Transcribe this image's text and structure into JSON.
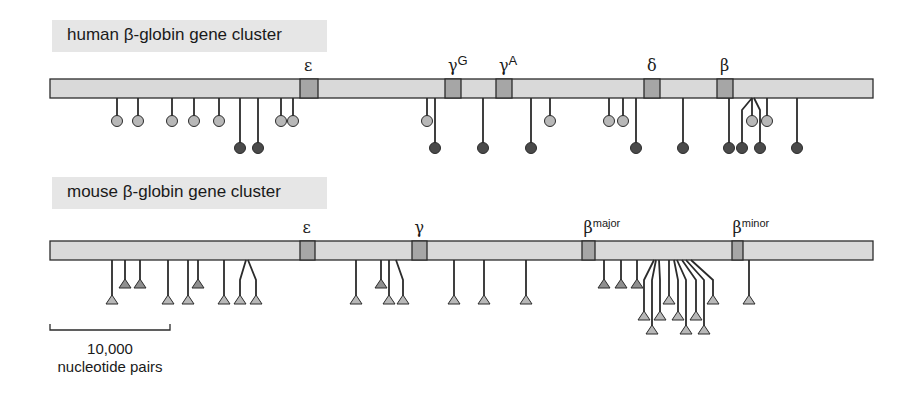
{
  "human": {
    "title": "human β-globin gene cluster",
    "bar": {
      "x1": 50,
      "x2": 873,
      "y": 79,
      "h": 19
    },
    "genes": [
      {
        "label": "ε",
        "sup": "",
        "x": 300,
        "w": 18
      },
      {
        "label": "γ",
        "sup": "G",
        "x": 445,
        "w": 16
      },
      {
        "label": "γ",
        "sup": "A",
        "x": 496,
        "w": 16
      },
      {
        "label": "δ",
        "sup": "",
        "x": 644,
        "w": 16
      },
      {
        "label": "β",
        "sup": "",
        "x": 717,
        "w": 16
      }
    ],
    "sites": [
      {
        "x": 117,
        "type": "light"
      },
      {
        "x": 138,
        "type": "light"
      },
      {
        "x": 172,
        "type": "light"
      },
      {
        "x": 194,
        "type": "light"
      },
      {
        "x": 219,
        "type": "light"
      },
      {
        "x": 240,
        "type": "dark"
      },
      {
        "x": 258,
        "type": "dark"
      },
      {
        "x": 281,
        "type": "light"
      },
      {
        "x": 293,
        "type": "light"
      },
      {
        "x": 427,
        "type": "light"
      },
      {
        "x": 435,
        "type": "dark"
      },
      {
        "x": 483,
        "type": "dark"
      },
      {
        "x": 531,
        "type": "dark"
      },
      {
        "x": 550,
        "type": "light"
      },
      {
        "x": 609,
        "type": "light"
      },
      {
        "x": 623,
        "type": "light"
      },
      {
        "x": 636,
        "type": "dark"
      },
      {
        "x": 683,
        "type": "dark"
      },
      {
        "x": 729,
        "type": "dark"
      },
      {
        "x": 742,
        "type": "dark",
        "from": 752
      },
      {
        "x": 752,
        "type": "light"
      },
      {
        "x": 760,
        "type": "dark",
        "from": 754
      },
      {
        "x": 767,
        "type": "light"
      },
      {
        "x": 797,
        "type": "dark"
      }
    ]
  },
  "mouse": {
    "title": "mouse β-globin gene cluster",
    "bar": {
      "x1": 50,
      "x2": 873,
      "y": 241,
      "h": 19
    },
    "genes": [
      {
        "label": "ε",
        "sup": "",
        "x": 300,
        "w": 15
      },
      {
        "label": "γ",
        "sup": "",
        "x": 412,
        "w": 15
      },
      {
        "label": "β",
        "sup": "major",
        "x": 582,
        "w": 13
      },
      {
        "label": "β",
        "sup": "minor",
        "x": 732,
        "w": 11
      }
    ],
    "sites": [
      {
        "x": 112,
        "level": 2
      },
      {
        "x": 125,
        "level": 1
      },
      {
        "x": 140,
        "level": 1
      },
      {
        "x": 168,
        "level": 2
      },
      {
        "x": 188,
        "level": 2
      },
      {
        "x": 198,
        "level": 1
      },
      {
        "x": 224,
        "level": 2
      },
      {
        "x": 240,
        "level": 2,
        "from": 246
      },
      {
        "x": 256,
        "level": 2,
        "from": 248
      },
      {
        "x": 356,
        "level": 2
      },
      {
        "x": 381,
        "level": 1
      },
      {
        "x": 389,
        "level": 2
      },
      {
        "x": 403,
        "level": 2,
        "from": 396
      },
      {
        "x": 454,
        "level": 2
      },
      {
        "x": 484,
        "level": 2
      },
      {
        "x": 526,
        "level": 2
      },
      {
        "x": 604,
        "level": 1
      },
      {
        "x": 621,
        "level": 1
      },
      {
        "x": 637,
        "level": 1
      },
      {
        "x": 644,
        "level": 3,
        "from": 654
      },
      {
        "x": 652,
        "level": 4,
        "from": 656
      },
      {
        "x": 660,
        "level": 3,
        "from": 659
      },
      {
        "x": 669,
        "level": 2
      },
      {
        "x": 678,
        "level": 3,
        "from": 674
      },
      {
        "x": 686,
        "level": 4,
        "from": 677
      },
      {
        "x": 696,
        "level": 3,
        "from": 682
      },
      {
        "x": 704,
        "level": 4,
        "from": 686
      },
      {
        "x": 713,
        "level": 2,
        "from": 691
      },
      {
        "x": 749,
        "level": 2
      }
    ]
  },
  "scale": {
    "value": "10,000",
    "unit": "nucleotide pairs",
    "x1": 50,
    "x2": 170,
    "y": 330
  },
  "colors": {
    "bar": "#d9d9d9",
    "gene": "#a6a6a6",
    "outline": "#2b2b2b",
    "light_site": "#b8b8b8",
    "dark_site": "#4a4a4a",
    "triangle": "#b8b8b8",
    "triangle_dark": "#8f8f8f"
  }
}
